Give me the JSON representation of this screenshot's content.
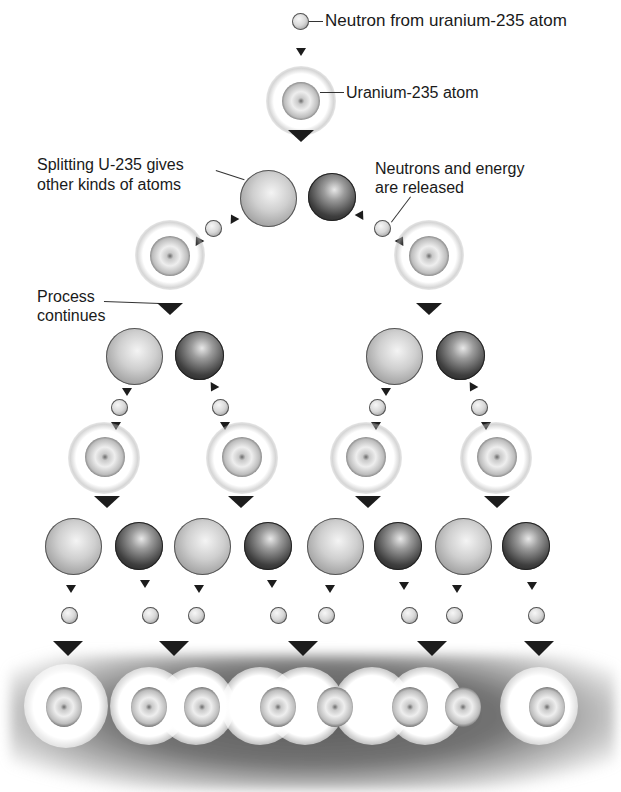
{
  "diagram": {
    "labels": {
      "neutron": "Neutron from uranium-235 atom",
      "uranium": "Uranium-235 atom",
      "splitting_line1": "Splitting U-235 gives",
      "splitting_line2": "other kinds of atoms",
      "released_line1": "Neutrons and energy",
      "released_line2": "are released",
      "process_line1": "Process",
      "process_line2": "continues"
    },
    "generations": [
      {
        "level": 1,
        "u235_atoms": 1,
        "fragments": 2,
        "neutrons_released": 2
      },
      {
        "level": 2,
        "u235_atoms": 2,
        "fragments": 4,
        "neutrons_released": 4
      },
      {
        "level": 3,
        "u235_atoms": 4,
        "fragments": 8,
        "neutrons_released": 8
      },
      {
        "level": 4,
        "u235_atoms": 8
      }
    ],
    "colors": {
      "ink": "#1c1c1c",
      "background": "#ffffff",
      "smudge": "#505050"
    }
  }
}
